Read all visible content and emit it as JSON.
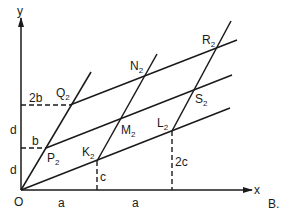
{
  "figure": {
    "panel_label": "B.",
    "axes": {
      "x_label": "x",
      "y_label": "y",
      "origin_label": "O"
    },
    "points": {
      "P": {
        "letter": "P",
        "sub": "2"
      },
      "Q": {
        "letter": "Q",
        "sub": "2"
      },
      "K": {
        "letter": "K",
        "sub": "2"
      },
      "M": {
        "letter": "M",
        "sub": "2"
      },
      "N": {
        "letter": "N",
        "sub": "2"
      },
      "L": {
        "letter": "L",
        "sub": "2"
      },
      "S": {
        "letter": "S",
        "sub": "2"
      },
      "R": {
        "letter": "R",
        "sub": "2"
      }
    },
    "dimensions": {
      "y_2b": "2b",
      "y_b": "b",
      "y_d_upper": "d",
      "y_d_lower": "d",
      "x_a_first": "a",
      "x_a_second": "a",
      "v_c": "c",
      "v_2c": "2c"
    }
  }
}
